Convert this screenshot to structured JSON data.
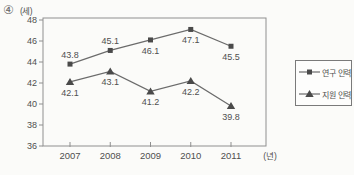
{
  "figure": {
    "number_label": "④"
  },
  "chart_data": {
    "type": "line",
    "title": "",
    "categories": [
      "2007",
      "2008",
      "2009",
      "2010",
      "2011"
    ],
    "series": [
      {
        "name": "연구 인력",
        "marker": "square",
        "values": [
          43.8,
          45.1,
          46.1,
          47.1,
          45.5
        ],
        "data_labels": [
          "43.8",
          "45.1",
          "46.1",
          "47.1",
          "45.5"
        ],
        "label_positions": [
          "above",
          "above",
          "below",
          "below",
          "below"
        ]
      },
      {
        "name": "지원 인력",
        "marker": "triangle",
        "values": [
          42.1,
          43.1,
          41.2,
          42.2,
          39.8
        ],
        "data_labels": [
          "42.1",
          "43.1",
          "41.2",
          "42.2",
          "39.8"
        ],
        "label_positions": [
          "below",
          "below",
          "below",
          "below",
          "below"
        ]
      }
    ],
    "xlabel": "",
    "ylabel": "",
    "ylabel_unit": "(세)",
    "xlabel_unit": "(년)",
    "ylim": [
      36,
      48
    ],
    "yticks": [
      48,
      46,
      44,
      42,
      40,
      38,
      36
    ],
    "grid": false,
    "legend_position": "right",
    "colors": {
      "line": "#6b6b6b",
      "marker": "#4a4a4a",
      "text": "#4f4f4f",
      "axis": "#8f8f8f",
      "legend_border": "#7a7a7a",
      "background": "#fbfbf9"
    }
  }
}
